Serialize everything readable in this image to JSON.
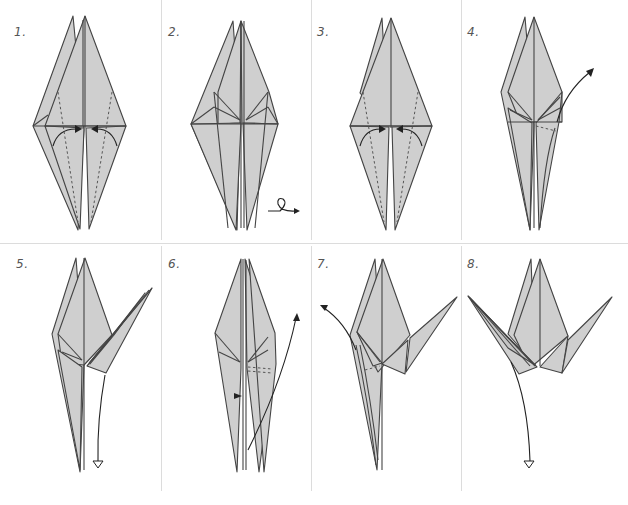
{
  "diagram": {
    "colors": {
      "paper_fill": "#cfcfcf",
      "outline": "#444444",
      "divider": "#dcdcdc",
      "background": "#ffffff"
    },
    "steps": [
      {
        "number": "1.",
        "action": "valley-fold both lower flaps to center",
        "symbols": [
          "dashed-valley-lines",
          "curved-arrow-left",
          "curved-arrow-right"
        ]
      },
      {
        "number": "2.",
        "action": "turn model over",
        "symbols": [
          "turn-over-arrow"
        ]
      },
      {
        "number": "3.",
        "action": "valley-fold both lower flaps to center",
        "symbols": [
          "dashed-valley-lines",
          "curved-arrow-left",
          "curved-arrow-right"
        ]
      },
      {
        "number": "4.",
        "action": "inside-reverse-fold right flap up",
        "symbols": [
          "dashed-fold-line",
          "curved-arrow-up-right"
        ]
      },
      {
        "number": "5.",
        "action": "unfold / fold flap back down",
        "symbols": [
          "curved-arrow-down-hollow-head"
        ]
      },
      {
        "number": "6.",
        "action": "inside-reverse-fold right flap up",
        "symbols": [
          "dashed-fold-line",
          "push-arrow",
          "curved-arrow-up"
        ]
      },
      {
        "number": "7.",
        "action": "inside-reverse-fold left flap up",
        "symbols": [
          "dashed-fold-line",
          "curved-arrow-up-left"
        ]
      },
      {
        "number": "8.",
        "action": "fold flap down",
        "symbols": [
          "curved-arrow-down-hollow-head"
        ]
      }
    ]
  }
}
